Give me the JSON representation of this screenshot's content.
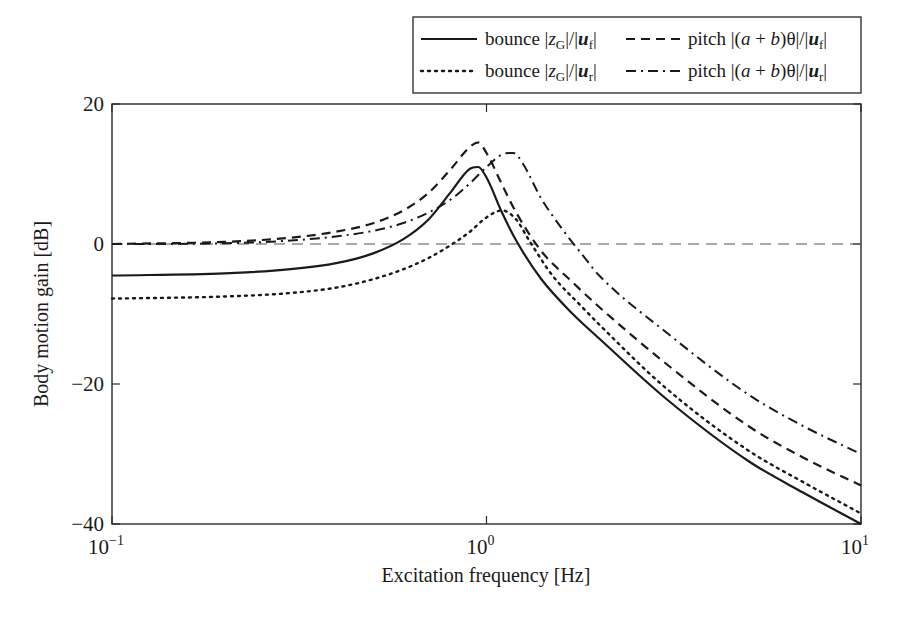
{
  "chart_data": {
    "type": "line",
    "title": "",
    "xlabel": "Excitation frequency [Hz]",
    "ylabel": "Body motion gain [dB]",
    "xscale": "log",
    "xlim": [
      0.1,
      10
    ],
    "ylim": [
      -40,
      20
    ],
    "xticks": [
      {
        "value": 0.1,
        "base": "10",
        "exp": "−1"
      },
      {
        "value": 1,
        "base": "10",
        "exp": "0"
      },
      {
        "value": 10,
        "base": "10",
        "exp": "1"
      }
    ],
    "yticks": [
      {
        "value": 20,
        "label": "20"
      },
      {
        "value": 0,
        "label": "0"
      },
      {
        "value": -20,
        "label": "−20"
      },
      {
        "value": -40,
        "label": "−40"
      }
    ],
    "grid": false,
    "reference_line": {
      "y": 0,
      "style": "dashed-thin"
    },
    "legend_position": "top-right, outside above plot",
    "series": [
      {
        "name": "bounce |zG|/|uf|",
        "legend": {
          "prefix": "bounce |",
          "var": "z",
          "sub": "G",
          "mid": "|/|",
          "var2": "u",
          "sub2": "f",
          "suffix": "|"
        },
        "style": "solid",
        "x": [
          0.1,
          0.2,
          0.3,
          0.4,
          0.5,
          0.6,
          0.7,
          0.8,
          0.9,
          0.95,
          1.0,
          1.1,
          1.2,
          1.4,
          1.7,
          2.0,
          3.0,
          5.0,
          7.0,
          10.0
        ],
        "y": [
          -4.5,
          -4.2,
          -3.6,
          -2.7,
          -1.3,
          0.7,
          3.5,
          7.3,
          10.7,
          11.0,
          9.5,
          4.5,
          0.5,
          -5.0,
          -10.0,
          -13.5,
          -22.0,
          -31.0,
          -35.5,
          -40.0
        ]
      },
      {
        "name": "pitch |(a+b)θ|/|uf|",
        "legend": {
          "prefix": "pitch |(",
          "var": "a",
          "mid": " + ",
          "var2": "b",
          "tail": ")θ|/|",
          "var3": "u",
          "sub3": "f",
          "suffix": "|"
        },
        "style": "dashed",
        "x": [
          0.1,
          0.2,
          0.3,
          0.4,
          0.5,
          0.6,
          0.7,
          0.8,
          0.9,
          0.95,
          1.0,
          1.1,
          1.2,
          1.4,
          1.7,
          2.0,
          3.0,
          5.0,
          7.0,
          10.0
        ],
        "y": [
          0.0,
          0.3,
          0.9,
          1.8,
          3.0,
          4.8,
          7.3,
          10.6,
          13.8,
          14.5,
          13.0,
          8.5,
          4.5,
          -1.0,
          -5.5,
          -9.0,
          -17.0,
          -26.0,
          -30.5,
          -34.5
        ]
      },
      {
        "name": "bounce |zG|/|ur|",
        "legend": {
          "prefix": "bounce |",
          "var": "z",
          "sub": "G",
          "mid": "|/|",
          "var2": "u",
          "sub2": "r",
          "suffix": "|"
        },
        "style": "dotted",
        "x": [
          0.1,
          0.2,
          0.3,
          0.4,
          0.5,
          0.6,
          0.7,
          0.8,
          0.9,
          1.0,
          1.1,
          1.2,
          1.3,
          1.5,
          1.8,
          2.0,
          3.0,
          5.0,
          7.0,
          10.0
        ],
        "y": [
          -7.8,
          -7.5,
          -7.0,
          -6.2,
          -5.0,
          -3.6,
          -2.0,
          -0.2,
          1.7,
          3.8,
          4.8,
          3.5,
          0.5,
          -4.5,
          -9.0,
          -11.5,
          -20.5,
          -29.5,
          -34.0,
          -38.5
        ]
      },
      {
        "name": "pitch |(a+b)θ|/|ur|",
        "legend": {
          "prefix": "pitch |(",
          "var": "a",
          "mid": " + ",
          "var2": "b",
          "tail": ")θ|/|",
          "var3": "u",
          "sub3": "r",
          "suffix": "|"
        },
        "style": "dash-dot",
        "x": [
          0.1,
          0.2,
          0.3,
          0.4,
          0.5,
          0.6,
          0.7,
          0.8,
          0.9,
          1.0,
          1.1,
          1.18,
          1.25,
          1.4,
          1.6,
          1.8,
          2.0,
          3.0,
          5.0,
          7.0,
          10.0
        ],
        "y": [
          0.0,
          0.1,
          0.5,
          1.1,
          1.9,
          3.0,
          4.5,
          6.3,
          8.6,
          11.0,
          12.8,
          13.0,
          11.5,
          6.5,
          2.0,
          -1.5,
          -4.5,
          -12.5,
          -21.5,
          -26.0,
          -30.0
        ]
      }
    ]
  }
}
